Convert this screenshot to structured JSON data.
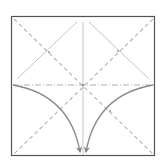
{
  "diagram": {
    "type": "origami-fold-diagram",
    "paper": {
      "x": 11,
      "y": 16,
      "size": 144,
      "border_color": "#555555",
      "fill": "#ffffff"
    },
    "colors": {
      "valley_fold": "#b0b0b0",
      "mountain_fold": "#b0b0b0",
      "crease": "#c4c4c4",
      "arrow": "#888888"
    },
    "lines": {
      "valley_diagonals": [
        {
          "name": "diagonal-top-left-to-bottom-right",
          "x1": 13,
          "y1": 18,
          "x2": 153,
          "y2": 154
        },
        {
          "name": "diagonal-top-right-to-bottom-left",
          "x1": 153,
          "y1": 18,
          "x2": 13,
          "y2": 154
        }
      ],
      "mountain_horizontal": {
        "name": "horizontal-midline",
        "x1": 13,
        "y1": 85,
        "x2": 153,
        "y2": 85
      },
      "creases": [
        {
          "name": "vertical-midline",
          "x1": 83,
          "y1": 22,
          "x2": 83,
          "y2": 154
        },
        {
          "name": "left-upper-crease",
          "x1": 17,
          "y1": 79,
          "x2": 77,
          "y2": 22
        },
        {
          "name": "right-upper-crease",
          "x1": 89,
          "y1": 22,
          "x2": 149,
          "y2": 79
        }
      ]
    },
    "arrows": [
      {
        "name": "left-fold-arrow",
        "from": [
          13,
          85
        ],
        "to": [
          80,
          153
        ]
      },
      {
        "name": "right-fold-arrow",
        "from": [
          153,
          85
        ],
        "to": [
          86,
          153
        ]
      }
    ]
  }
}
